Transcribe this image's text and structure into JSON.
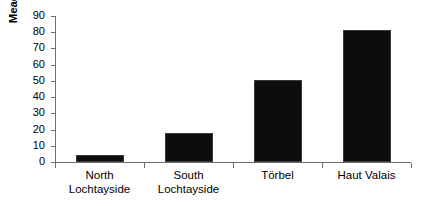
{
  "chart_data": {
    "type": "bar",
    "title": "",
    "subtitle": "",
    "xlabel": "",
    "ylabel": "Meadow as % of total land",
    "categories": [
      "North Lochtayside",
      "South Lochtayside",
      "Törbel",
      "Haut Valais"
    ],
    "category_lines": [
      [
        "North",
        "Lochtayside"
      ],
      [
        "South",
        "Lochtayside"
      ],
      [
        "Törbel"
      ],
      [
        "Haut Valais"
      ]
    ],
    "values": [
      4.5,
      18,
      50.5,
      81.5
    ],
    "ylim": [
      0,
      90
    ],
    "ytick_values": [
      0,
      10,
      20,
      30,
      40,
      50,
      60,
      70,
      80,
      90
    ],
    "ytick_labels": [
      "0",
      "10",
      "20",
      "30",
      "40",
      "50",
      "60",
      "70",
      "80",
      "90"
    ],
    "grid": false,
    "legend": false,
    "legend_position": "none",
    "bar_color": "#0d0d0d",
    "axis_color": "#6e6e6e",
    "background_color": "#ffffff",
    "text_color": "#000000"
  }
}
